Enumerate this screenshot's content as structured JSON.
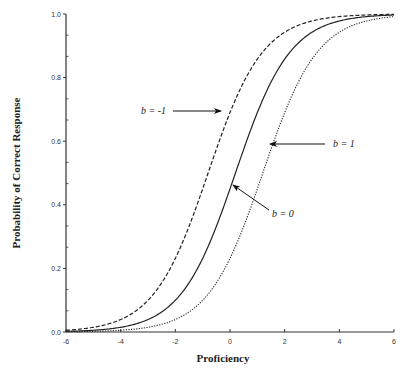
{
  "chart_data": {
    "type": "line",
    "title": "",
    "xlabel": "Proficiency",
    "ylabel": "Probability of Correct Response",
    "xlim": [
      -6,
      6
    ],
    "ylim": [
      0.0,
      1.0
    ],
    "xticks": [
      -6,
      -4,
      -2,
      0,
      2,
      4,
      6
    ],
    "xtick_labels": [
      "-6",
      "-4",
      "-2",
      "0",
      "2",
      "4",
      "6"
    ],
    "yticks": [
      0.0,
      0.2,
      0.4,
      0.6,
      0.8,
      1.0
    ],
    "ytick_labels": [
      "0.0",
      "0.2",
      "0.4",
      "0.6",
      "0.8",
      "1.0"
    ],
    "y_minor_per_major": 2,
    "grid": false,
    "legend": "none (curves labeled with arrow annotations)",
    "x": [
      -6,
      -5,
      -4,
      -3,
      -2,
      -1,
      0,
      1,
      2,
      3,
      4,
      5,
      6
    ],
    "series": [
      {
        "name": "b = -1",
        "style": "dashed",
        "b": -1,
        "values": [
          0.01,
          0.02,
          0.05,
          0.12,
          0.27,
          0.5,
          0.73,
          0.88,
          0.95,
          0.98,
          0.99,
          1.0,
          1.0
        ]
      },
      {
        "name": "b = 0",
        "style": "solid",
        "b": 0,
        "values": [
          0.0,
          0.01,
          0.02,
          0.05,
          0.12,
          0.27,
          0.5,
          0.73,
          0.88,
          0.95,
          0.98,
          0.99,
          1.0
        ]
      },
      {
        "name": "b = 1",
        "style": "dotted",
        "b": 1,
        "values": [
          0.0,
          0.0,
          0.01,
          0.02,
          0.05,
          0.12,
          0.27,
          0.5,
          0.73,
          0.88,
          0.95,
          0.98,
          0.99
        ]
      }
    ],
    "annotations": [
      {
        "text": "b = -1",
        "target_series": "b = -1",
        "arrow_direction": "right"
      },
      {
        "text": "b = 1",
        "target_series": "b = 1",
        "arrow_direction": "left"
      },
      {
        "text": "b = 0",
        "target_series": "b = 0",
        "arrow_direction": "up-left"
      }
    ]
  }
}
